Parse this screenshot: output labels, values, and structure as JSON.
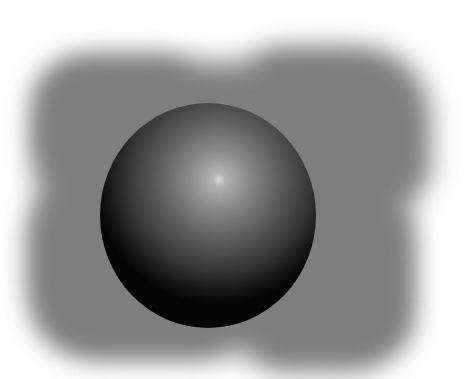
{
  "scene": {
    "description": "Rendered glossy dark sphere on a soft-edged gray backdrop",
    "background_color": "#ffffff",
    "backdrop_color": "#7e7e7e",
    "sphere": {
      "base_color": "#050505",
      "highlight_color": "#dcdcdc",
      "center": [
        208,
        215
      ],
      "size": [
        216,
        225
      ]
    }
  }
}
